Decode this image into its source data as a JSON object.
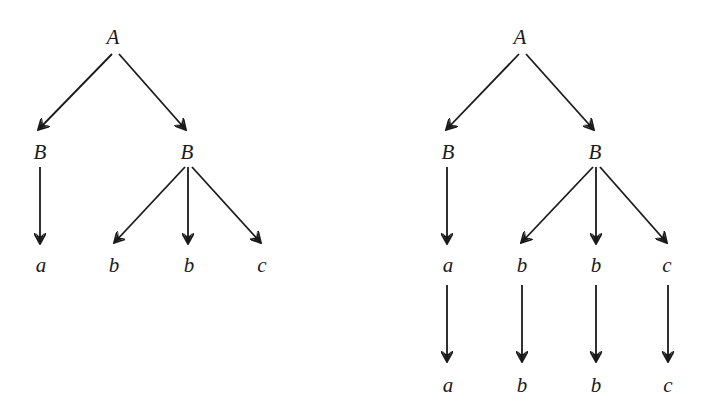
{
  "diagram": {
    "type": "derivation-trees",
    "colors": {
      "ink": "#1a1a1a",
      "background": "#ffffff"
    },
    "trees": [
      {
        "id": "left-tree",
        "nodes": [
          {
            "id": "A",
            "label": "A",
            "x": 113,
            "y": 37
          },
          {
            "id": "B1",
            "label": "B",
            "x": 40,
            "y": 152
          },
          {
            "id": "B2",
            "label": "B",
            "x": 187,
            "y": 152
          },
          {
            "id": "a1",
            "label": "a",
            "x": 41,
            "y": 265
          },
          {
            "id": "b1",
            "label": "b",
            "x": 114,
            "y": 265
          },
          {
            "id": "b2",
            "label": "b",
            "x": 189,
            "y": 265
          },
          {
            "id": "c1",
            "label": "c",
            "x": 262,
            "y": 265
          }
        ],
        "edges": [
          {
            "from": "A",
            "to": "B1",
            "x1": 112,
            "y1": 54,
            "x2": 38,
            "y2": 130
          },
          {
            "from": "A",
            "to": "B2",
            "x1": 119,
            "y1": 54,
            "x2": 186,
            "y2": 130
          },
          {
            "from": "B1",
            "to": "a1",
            "x1": 40,
            "y1": 167,
            "x2": 40,
            "y2": 244
          },
          {
            "from": "B2",
            "to": "b1",
            "x1": 185,
            "y1": 167,
            "x2": 114,
            "y2": 243
          },
          {
            "from": "B2",
            "to": "b2",
            "x1": 188,
            "y1": 167,
            "x2": 188,
            "y2": 244
          },
          {
            "from": "B2",
            "to": "c1",
            "x1": 192,
            "y1": 167,
            "x2": 261,
            "y2": 243
          }
        ]
      },
      {
        "id": "right-tree",
        "nodes": [
          {
            "id": "A",
            "label": "A",
            "x": 520,
            "y": 37
          },
          {
            "id": "B1",
            "label": "B",
            "x": 448,
            "y": 152
          },
          {
            "id": "B2",
            "label": "B",
            "x": 595,
            "y": 152
          },
          {
            "id": "a1",
            "label": "a",
            "x": 448,
            "y": 265
          },
          {
            "id": "b1",
            "label": "b",
            "x": 522,
            "y": 265
          },
          {
            "id": "b2",
            "label": "b",
            "x": 596,
            "y": 265
          },
          {
            "id": "c1",
            "label": "c",
            "x": 667,
            "y": 265
          },
          {
            "id": "a2",
            "label": "a",
            "x": 448,
            "y": 385
          },
          {
            "id": "b3",
            "label": "b",
            "x": 522,
            "y": 385
          },
          {
            "id": "b4",
            "label": "b",
            "x": 596,
            "y": 385
          },
          {
            "id": "c2",
            "label": "c",
            "x": 668,
            "y": 385
          }
        ],
        "edges": [
          {
            "from": "A",
            "to": "B1",
            "x1": 519,
            "y1": 54,
            "x2": 446,
            "y2": 130
          },
          {
            "from": "A",
            "to": "B2",
            "x1": 526,
            "y1": 54,
            "x2": 594,
            "y2": 130
          },
          {
            "from": "B1",
            "to": "a1",
            "x1": 447,
            "y1": 167,
            "x2": 447,
            "y2": 244
          },
          {
            "from": "B2",
            "to": "b1",
            "x1": 593,
            "y1": 167,
            "x2": 521,
            "y2": 243
          },
          {
            "from": "B2",
            "to": "b2",
            "x1": 596,
            "y1": 167,
            "x2": 596,
            "y2": 244
          },
          {
            "from": "B2",
            "to": "c1",
            "x1": 600,
            "y1": 167,
            "x2": 667,
            "y2": 243
          },
          {
            "from": "a1",
            "to": "a2",
            "x1": 447,
            "y1": 285,
            "x2": 447,
            "y2": 362
          },
          {
            "from": "b1",
            "to": "b3",
            "x1": 522,
            "y1": 285,
            "x2": 522,
            "y2": 362
          },
          {
            "from": "b2",
            "to": "b4",
            "x1": 596,
            "y1": 285,
            "x2": 596,
            "y2": 362
          },
          {
            "from": "c1",
            "to": "c2",
            "x1": 668,
            "y1": 285,
            "x2": 668,
            "y2": 362
          }
        ]
      }
    ]
  }
}
